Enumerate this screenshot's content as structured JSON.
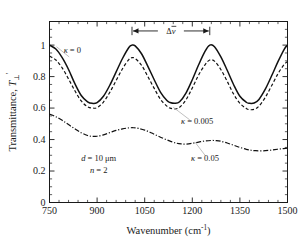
{
  "chart_data": {
    "type": "line",
    "title": "",
    "xlabel": "Wavenumber (cm",
    "xlabel_sup": "-1",
    "xlabel_tail": ")",
    "ylabel_main": "Transmittance, ",
    "ylabel_symbol": "T",
    "ylabel_prime": "'",
    "ylabel_sub": "⊥",
    "xlim": [
      750,
      1500
    ],
    "ylim": [
      0,
      1.15
    ],
    "xticks": [
      750,
      900,
      1050,
      1200,
      1350,
      1500
    ],
    "xtick_labels": [
      "750",
      "900",
      "1050",
      "1200",
      "1350",
      "1500"
    ],
    "yticks": [
      0,
      0.2,
      0.4,
      0.6,
      0.8,
      1
    ],
    "ytick_labels": [
      "0",
      "0.2",
      "0.4",
      "0.6",
      "0.8",
      "1"
    ],
    "x_minor_interval": 30,
    "y_minor_interval": 0.05,
    "grid": false,
    "legend_position": "inline-annotations",
    "series": [
      {
        "name": "κ = 0",
        "style": "solid",
        "color": "#111111",
        "x": [
          750,
          770,
          790,
          810,
          830,
          850,
          870,
          885,
          900,
          920,
          940,
          960,
          980,
          1000,
          1010,
          1020,
          1040,
          1060,
          1080,
          1100,
          1120,
          1130,
          1145,
          1160,
          1180,
          1200,
          1220,
          1240,
          1255,
          1270,
          1290,
          1310,
          1330,
          1350,
          1370,
          1380,
          1395,
          1410,
          1430,
          1450,
          1470,
          1490,
          1500
        ],
        "y": [
          1.0,
          0.975,
          0.92,
          0.845,
          0.755,
          0.68,
          0.64,
          0.63,
          0.635,
          0.675,
          0.745,
          0.83,
          0.915,
          0.985,
          1.0,
          0.995,
          0.945,
          0.865,
          0.78,
          0.7,
          0.648,
          0.635,
          0.63,
          0.64,
          0.695,
          0.78,
          0.875,
          0.96,
          1.0,
          0.99,
          0.925,
          0.84,
          0.75,
          0.675,
          0.637,
          0.63,
          0.632,
          0.655,
          0.72,
          0.805,
          0.895,
          0.975,
          1.0
        ]
      },
      {
        "name": "κ = 0.005",
        "style": "dashed",
        "color": "#111111",
        "x": [
          750,
          770,
          790,
          810,
          830,
          850,
          870,
          885,
          900,
          920,
          940,
          960,
          980,
          1000,
          1010,
          1020,
          1040,
          1060,
          1080,
          1100,
          1120,
          1130,
          1145,
          1160,
          1180,
          1200,
          1220,
          1240,
          1255,
          1270,
          1290,
          1310,
          1330,
          1350,
          1370,
          1380,
          1395,
          1410,
          1430,
          1450,
          1470,
          1490,
          1500
        ],
        "y": [
          0.93,
          0.905,
          0.855,
          0.785,
          0.71,
          0.645,
          0.608,
          0.6,
          0.603,
          0.638,
          0.7,
          0.775,
          0.85,
          0.908,
          0.92,
          0.915,
          0.872,
          0.8,
          0.725,
          0.655,
          0.612,
          0.6,
          0.595,
          0.605,
          0.652,
          0.728,
          0.81,
          0.875,
          0.905,
          0.898,
          0.845,
          0.77,
          0.69,
          0.63,
          0.598,
          0.59,
          0.592,
          0.612,
          0.668,
          0.742,
          0.818,
          0.878,
          0.895
        ]
      },
      {
        "name": "κ = 0.05",
        "style": "dashdot",
        "color": "#111111",
        "x": [
          750,
          770,
          790,
          810,
          830,
          850,
          870,
          885,
          900,
          920,
          940,
          960,
          980,
          1000,
          1015,
          1030,
          1050,
          1070,
          1090,
          1110,
          1130,
          1150,
          1165,
          1180,
          1200,
          1220,
          1240,
          1260,
          1275,
          1290,
          1310,
          1330,
          1350,
          1370,
          1385,
          1400,
          1420,
          1440,
          1460,
          1480,
          1500
        ],
        "y": [
          0.562,
          0.545,
          0.522,
          0.495,
          0.468,
          0.443,
          0.426,
          0.42,
          0.421,
          0.43,
          0.444,
          0.458,
          0.468,
          0.474,
          0.475,
          0.471,
          0.46,
          0.443,
          0.424,
          0.406,
          0.39,
          0.377,
          0.372,
          0.371,
          0.376,
          0.384,
          0.391,
          0.394,
          0.393,
          0.389,
          0.378,
          0.364,
          0.35,
          0.338,
          0.332,
          0.329,
          0.328,
          0.331,
          0.336,
          0.341,
          0.345
        ]
      }
    ],
    "annotations": [
      {
        "name": "delta-nu-bar",
        "text": "Δν̅",
        "kind": "span-arrow",
        "x_from": 1010,
        "x_to": 1255,
        "y": 1.09
      },
      {
        "name": "kappa-0-label",
        "text": "κ = 0",
        "x": 822,
        "y": 0.95
      },
      {
        "name": "kappa-0005-label",
        "text": "κ = 0.005",
        "x": 1215,
        "y": 0.5
      },
      {
        "name": "kappa-005-label",
        "text": "κ = 0.05",
        "x": 1240,
        "y": 0.265
      },
      {
        "name": "thickness-label",
        "text": "d = 10 μm",
        "x": 905,
        "y": 0.265
      },
      {
        "name": "refractive-index-label",
        "text": "n = 2",
        "x": 905,
        "y": 0.185
      }
    ]
  },
  "colors": {
    "axis": "#1a1a1a",
    "curve": "#111111",
    "background": "#ffffff",
    "leader": "#b9b9b9"
  }
}
